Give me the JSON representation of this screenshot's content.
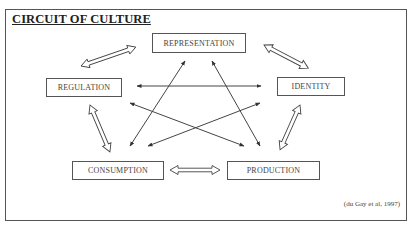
{
  "title": "CIRCUIT OF CULTURE",
  "citation": "(du Gay et al, 1997)",
  "nodes": {
    "representation": "REPRESENTATION",
    "regulation": "REGULATION",
    "identity": "IDENTITY",
    "consumption": "CONSUMPTION",
    "production": "PRODUCTION"
  },
  "outer_links": [
    {
      "from": "regulation",
      "to": "representation",
      "style": "hollow-double-arrow"
    },
    {
      "from": "representation",
      "to": "identity",
      "style": "hollow-double-arrow"
    },
    {
      "from": "identity",
      "to": "production",
      "style": "hollow-double-arrow"
    },
    {
      "from": "production",
      "to": "consumption",
      "style": "hollow-double-arrow"
    },
    {
      "from": "consumption",
      "to": "regulation",
      "style": "hollow-double-arrow"
    }
  ],
  "inner_links": [
    {
      "from": "representation",
      "to": "consumption",
      "style": "thin-double-arrow"
    },
    {
      "from": "representation",
      "to": "production",
      "style": "thin-double-arrow"
    },
    {
      "from": "regulation",
      "to": "identity",
      "style": "thin-double-arrow"
    },
    {
      "from": "regulation",
      "to": "production",
      "style": "thin-double-arrow"
    },
    {
      "from": "identity",
      "to": "consumption",
      "style": "thin-double-arrow"
    }
  ],
  "colors": {
    "line": "#444444",
    "border": "#555555",
    "background": "#ffffff"
  }
}
